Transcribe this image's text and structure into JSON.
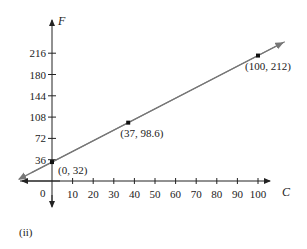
{
  "chart_data": {
    "type": "line",
    "title": "",
    "xlabel": "C",
    "ylabel": "F",
    "x_ticks": [
      10,
      20,
      30,
      40,
      50,
      60,
      70,
      80,
      90,
      100
    ],
    "y_ticks": [
      36,
      72,
      108,
      144,
      180,
      216
    ],
    "origin_label": "0",
    "xlim": [
      -17,
      113
    ],
    "ylim": [
      -40,
      250
    ],
    "grid": false,
    "series": [
      {
        "name": "F = 1.8C + 32",
        "x": [
          0,
          37,
          100
        ],
        "y": [
          32,
          98.6,
          212
        ],
        "point_labels": [
          "(0, 32)",
          "(37, 98.6)",
          "(100, 212)"
        ]
      }
    ]
  },
  "caption": "(ii)"
}
